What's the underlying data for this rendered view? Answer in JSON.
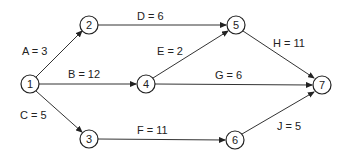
{
  "diagram": {
    "type": "activity-on-arrow network",
    "nodes": [
      {
        "id": "1",
        "label": "1",
        "x": 30,
        "y": 84
      },
      {
        "id": "2",
        "label": "2",
        "x": 89,
        "y": 25
      },
      {
        "id": "3",
        "label": "3",
        "x": 89,
        "y": 139
      },
      {
        "id": "4",
        "label": "4",
        "x": 146,
        "y": 84
      },
      {
        "id": "5",
        "label": "5",
        "x": 236,
        "y": 25
      },
      {
        "id": "6",
        "label": "6",
        "x": 235,
        "y": 140
      },
      {
        "id": "7",
        "label": "7",
        "x": 322,
        "y": 85
      }
    ],
    "edges": [
      {
        "from": "1",
        "to": "2",
        "activity": "A",
        "duration": 3,
        "label": "A = 3"
      },
      {
        "from": "1",
        "to": "4",
        "activity": "B",
        "duration": 12,
        "label": "B = 12"
      },
      {
        "from": "1",
        "to": "3",
        "activity": "C",
        "duration": 5,
        "label": "C = 5"
      },
      {
        "from": "2",
        "to": "5",
        "activity": "D",
        "duration": 6,
        "label": "D = 6"
      },
      {
        "from": "4",
        "to": "5",
        "activity": "E",
        "duration": 2,
        "label": "E = 2"
      },
      {
        "from": "3",
        "to": "6",
        "activity": "F",
        "duration": 11,
        "label": "F = 11"
      },
      {
        "from": "4",
        "to": "7",
        "activity": "G",
        "duration": 6,
        "label": "G = 6"
      },
      {
        "from": "5",
        "to": "7",
        "activity": "H",
        "duration": 11,
        "label": "H = 11"
      },
      {
        "from": "6",
        "to": "7",
        "activity": "J",
        "duration": 5,
        "label": "J = 5"
      }
    ]
  }
}
